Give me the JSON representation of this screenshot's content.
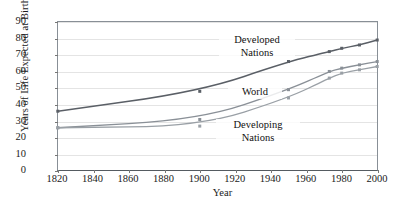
{
  "chart_data": {
    "type": "line",
    "title": "",
    "xlabel": "Year",
    "ylabel": "Years of Life Expected at Birth",
    "x": [
      1820,
      1900,
      1950,
      1973,
      1980,
      1990,
      2000
    ],
    "xlim": [
      1820,
      2000
    ],
    "ylim": [
      0,
      90
    ],
    "xticks": [
      1820,
      1840,
      1860,
      1880,
      1900,
      1920,
      1940,
      1960,
      1980,
      2000
    ],
    "yticks": [
      0,
      10,
      20,
      30,
      40,
      50,
      60,
      70,
      80,
      90
    ],
    "grid": true,
    "legend_position": "inline-annotations",
    "series": [
      {
        "name": "Developed Nations",
        "color": "#5a5f66",
        "values": [
          36,
          48,
          66,
          72,
          74,
          76,
          79
        ]
      },
      {
        "name": "World",
        "color": "#8a9097",
        "values": [
          26,
          31,
          49,
          60,
          62,
          64,
          66
        ]
      },
      {
        "name": "Developing Nations",
        "color": "#9aa0a6",
        "values": [
          26,
          27,
          44,
          56,
          59,
          61,
          63
        ]
      }
    ],
    "annotations": [
      {
        "text_line1": "Developed",
        "text_line2": "Nations"
      },
      {
        "text_line1": "World",
        "text_line2": ""
      },
      {
        "text_line1": "Developing",
        "text_line2": "Nations"
      }
    ]
  },
  "axis": {
    "ylabel": "Years of Life Expected at Birth",
    "xlabel": "Year",
    "yticks": [
      "90",
      "80",
      "70",
      "60",
      "50",
      "40",
      "30",
      "20",
      "10",
      "0"
    ],
    "xticks": [
      "1820",
      "1840",
      "1860",
      "1880",
      "1900",
      "1920",
      "1940",
      "1960",
      "1980",
      "2000"
    ]
  },
  "labels": {
    "developed_l1": "Developed",
    "developed_l2": "Nations",
    "world": "World",
    "developing_l1": "Developing",
    "developing_l2": "Nations"
  },
  "colors": {
    "developed": "#5a5f66",
    "world": "#8a9097",
    "developing": "#9aa0a6",
    "grid": "#e4e4e4",
    "frame": "#888f96",
    "text": "#1a1a1a"
  }
}
